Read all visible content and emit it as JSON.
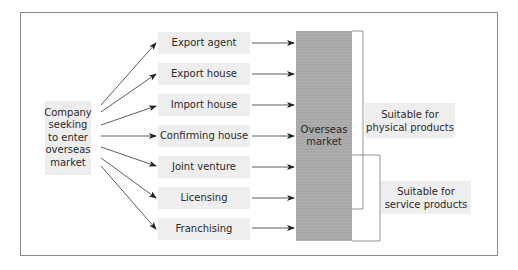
{
  "diagram": {
    "source": {
      "label_lines": [
        "Company",
        "seeking",
        "to enter",
        "overseas",
        "market"
      ]
    },
    "methods": [
      {
        "label": "Export agent"
      },
      {
        "label": "Export house"
      },
      {
        "label": "Import house"
      },
      {
        "label": "Confirming house"
      },
      {
        "label": "Joint venture"
      },
      {
        "label": "Licensing"
      },
      {
        "label": "Franchising"
      }
    ],
    "target": {
      "label_lines": [
        "Overseas",
        "market"
      ]
    },
    "groups": [
      {
        "label_lines": [
          "Suitable for",
          "physical products"
        ],
        "covers": [
          "Export agent",
          "Export house",
          "Import house",
          "Confirming house",
          "Joint venture"
        ]
      },
      {
        "label_lines": [
          "Suitable for",
          "service products"
        ],
        "covers": [
          "Joint venture",
          "Licensing",
          "Franchising"
        ]
      }
    ],
    "colors": {
      "box_fill": "#eeeeee",
      "market_fill": "#a8a8a8",
      "frame_border": "#8a8a8a",
      "line": "#333333"
    }
  }
}
